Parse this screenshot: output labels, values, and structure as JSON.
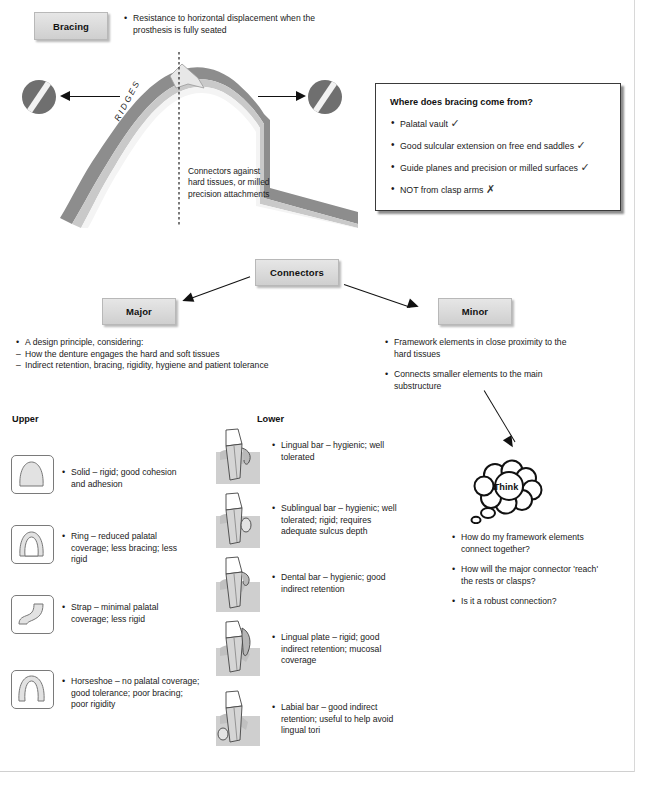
{
  "bracing": {
    "box_label": "Bracing",
    "definition": "Resistance to horizontal displacement when the prosthesis is fully seated",
    "ridges_label": "RIDGES",
    "connector_note": "Connectors against hard tissues, or milled precision attachments",
    "left_icon": "shaded-disc-icon",
    "right_icon": "shaded-disc-icon"
  },
  "bracing_card": {
    "title": "Where does bracing come from?",
    "items": [
      {
        "text": "Palatal vault",
        "mark": "✓"
      },
      {
        "text": "Good sulcular extension on free end saddles",
        "mark": "✓"
      },
      {
        "text": "Guide planes and precision or milled surfaces",
        "mark": "✓"
      },
      {
        "text": "NOT from clasp arms",
        "mark": "✗"
      }
    ]
  },
  "connectors": {
    "box_label": "Connectors",
    "major": {
      "box_label": "Major",
      "bullets": [
        {
          "style": "bullet",
          "text": "A design principle, considering:"
        },
        {
          "style": "dash",
          "text": "How the denture engages the hard and soft tissues"
        },
        {
          "style": "dash",
          "text": "Indirect retention, bracing, rigidity, hygiene and patient tolerance"
        }
      ]
    },
    "minor": {
      "box_label": "Minor",
      "bullets": [
        {
          "style": "bullet",
          "text": "Framework elements in close proximity to the hard tissues"
        },
        {
          "style": "bullet",
          "text": "Connects smaller elements to the main substructure"
        }
      ]
    }
  },
  "think": {
    "cloud_label": "Think",
    "questions": [
      "How do my framework elements connect together?",
      "How will the major connector 'reach' the rests or clasps?",
      "Is it a robust connection?"
    ]
  },
  "upper": {
    "heading": "Upper",
    "items": [
      {
        "icon": "solid-palate-icon",
        "text": "Solid – rigid; good cohesion and adhesion"
      },
      {
        "icon": "ring-palate-icon",
        "text": "Ring – reduced palatal coverage; less bracing; less rigid"
      },
      {
        "icon": "strap-palate-icon",
        "text": "Strap – minimal palatal coverage; less rigid"
      },
      {
        "icon": "horseshoe-palate-icon",
        "text": "Horseshoe – no palatal coverage; good tolerance; poor bracing; poor rigidity"
      }
    ]
  },
  "lower": {
    "heading": "Lower",
    "items": [
      {
        "icon": "tooth-lingual-bar-icon",
        "text": "Lingual bar – hygienic; well tolerated"
      },
      {
        "icon": "tooth-sublingual-bar-icon",
        "text": "Sublingual bar – hygienic; well tolerated; rigid; requires adequate sulcus depth"
      },
      {
        "icon": "tooth-dental-bar-icon",
        "text": "Dental bar – hygienic; good indirect retention"
      },
      {
        "icon": "tooth-lingual-plate-icon",
        "text": "Lingual plate – rigid; good indirect retention; mucosal coverage"
      },
      {
        "icon": "tooth-labial-bar-icon",
        "text": "Labial bar – good indirect retention; useful to help avoid lingual tori"
      }
    ]
  },
  "colors": {
    "ridge_outer": "#8d8d8d",
    "ridge_mid": "#c9c9c9",
    "ridge_inner": "#f4f4f4",
    "box_fill": "#dcdcdc",
    "ink": "#1a1a1a"
  }
}
